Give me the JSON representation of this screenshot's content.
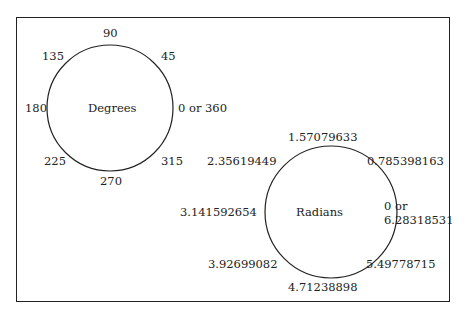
{
  "degrees": {
    "title": "Degrees",
    "labels": {
      "d90": "90",
      "d45": "45",
      "d0": "0 or 360",
      "d315": "315",
      "d270": "270",
      "d225": "225",
      "d180": "180",
      "d135": "135"
    }
  },
  "radians": {
    "title": "Radians",
    "labels": {
      "r90": "1.57079633",
      "r45": "0.785398163",
      "r0a": "0 or",
      "r0b": "6.28318531",
      "r315": "5.49778715",
      "r270": "4.71238898",
      "r225": "3.92699082",
      "r180": "3.141592654",
      "r135": "2.35619449"
    }
  },
  "colors": {
    "line": "#222222",
    "background": "#ffffff"
  }
}
